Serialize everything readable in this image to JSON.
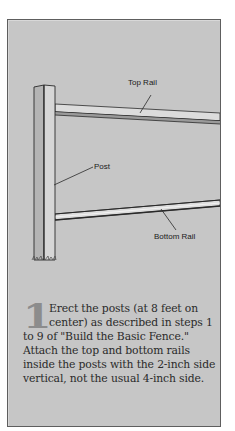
{
  "illustration": {
    "labels": {
      "top_rail": "Top Rail",
      "post": "Post",
      "bottom_rail": "Bottom Rail"
    },
    "colors": {
      "panel_background": "#c6c6c6",
      "panel_border": "#5e5e5e",
      "post_face": "#d6d6d6",
      "post_side": "#b4b4b4",
      "rail_face": "#dcdcdc",
      "outline": "#2a2a2a"
    }
  },
  "step": {
    "number": "1",
    "text": "Erect the posts (at 8 feet on center) as described in steps 1 to 9 of \"Build the Basic Fence.\" Attach the top and bottom rails inside the posts with the 2-inch side vertical, not the usual 4-inch side."
  }
}
